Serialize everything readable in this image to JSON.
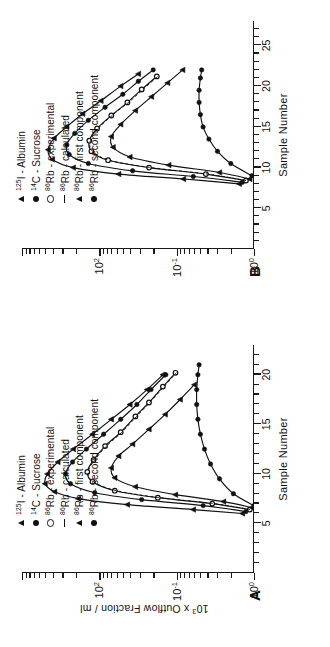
{
  "figure": {
    "orientation": "rotated-90-ccw",
    "panels": [
      {
        "letter": "A",
        "xaxis": {
          "title": "Sample Number",
          "ticks": [
            "5",
            "10",
            "15",
            "20"
          ],
          "tickvalues": [
            5,
            10,
            15,
            20
          ],
          "range": [
            0,
            23
          ]
        },
        "yaxis": {
          "title_pre": "10",
          "title_sup": "3",
          "title_post": " x  Outflow  Fraction / ml",
          "ticks": [
            "10",
            "10",
            "10"
          ],
          "tick_sups": [
            "0",
            "-1",
            "2"
          ],
          "scale": "log",
          "range": [
            1,
            200
          ]
        }
      },
      {
        "letter": "B",
        "xaxis": {
          "title": "Sample Number",
          "ticks": [
            "5",
            "10",
            "15",
            "20",
            "25"
          ],
          "tickvalues": [
            5,
            10,
            15,
            20,
            25
          ],
          "range": [
            0,
            28
          ]
        },
        "yaxis": {
          "title_pre": "10",
          "title_sup": "3",
          "title_post": " x  Outflow  Fraction / ml",
          "ticks": [
            "10",
            "10",
            "10"
          ],
          "tick_sups": [
            "0",
            "-1",
            "2"
          ],
          "scale": "log",
          "range": [
            1,
            200
          ]
        }
      }
    ]
  },
  "legend": {
    "items": [
      {
        "symbol": "filled-triangle-up",
        "iso_pre": "125",
        "element": "I",
        "sep": " - ",
        "label": "Albumin",
        "full": "125I - Albumin"
      },
      {
        "symbol": "filled-circle",
        "iso_pre": "14",
        "element": "C",
        "sep": " - ",
        "label": "Sucrose",
        "full": "14C - Sucrose"
      },
      {
        "symbol": "open-circle",
        "iso_pre": "86",
        "element": "Rb",
        "sep": " - ",
        "label": "experimental",
        "full": "86Rb - experimental"
      },
      {
        "symbol": "dash-line",
        "iso_pre": "86",
        "element": "Rb",
        "sep": " - ",
        "label": "calculated",
        "full": "86Rb - calculated"
      },
      {
        "symbol": "filled-triangle-up",
        "iso_pre": "86",
        "element": "Rb",
        "sep": " - ",
        "label": "first component",
        "full": "86Rb - first component"
      },
      {
        "symbol": "filled-circle",
        "iso_pre": "86",
        "element": "Rb",
        "sep": " - ",
        "label": "second component",
        "full": "86Rb - second component"
      }
    ]
  },
  "chart_data": [
    {
      "type": "line",
      "panel": "A",
      "title": "",
      "xlabel": "Sample Number",
      "ylabel": "10^3 x Outflow Fraction / ml",
      "xlim": [
        0,
        23
      ],
      "ylim": [
        1,
        200
      ],
      "yscale": "log",
      "grid": false,
      "legend_position": "top-right",
      "series": [
        {
          "name": "125I - Albumin",
          "marker": "filled-triangle-up",
          "x": [
            6.0,
            6.4,
            6.9,
            7.5,
            8.2,
            9.0,
            10.0,
            11.2,
            12.5,
            14.0,
            15.5,
            17.0,
            18.5,
            20.0
          ],
          "y": [
            1.3,
            4.0,
            18,
            55,
            95,
            118,
            112,
            88,
            62,
            40,
            26,
            17,
            11.5,
            8.0
          ]
        },
        {
          "name": "14C - Sucrose",
          "marker": "filled-circle",
          "x": [
            6.2,
            6.8,
            7.4,
            8.1,
            9.0,
            10.0,
            11.2,
            12.5,
            14.0,
            15.5,
            17.0,
            18.5,
            20.0
          ],
          "y": [
            1.2,
            3.2,
            13,
            38,
            66,
            74,
            63,
            46,
            31,
            21,
            14.5,
            10.5,
            7.5
          ]
        },
        {
          "name": "86Rb - experimental",
          "marker": "open-circle",
          "x": [
            6.4,
            7.0,
            7.6,
            8.3,
            9.2,
            10.2,
            11.4,
            12.8,
            14.2,
            15.8,
            17.2,
            18.8,
            20.2
          ],
          "y": [
            1.1,
            2.6,
            9.0,
            24,
            40,
            45,
            39,
            30,
            21,
            15,
            11,
            8.0,
            6.0
          ]
        },
        {
          "name": "86Rb - calculated",
          "marker": "dash-line",
          "x": [
            6.4,
            7.0,
            7.6,
            8.3,
            9.2,
            10.2,
            11.4,
            12.8,
            14.2,
            15.8,
            17.2,
            18.8,
            20.2
          ],
          "y": [
            1.1,
            2.5,
            8.6,
            23,
            39,
            44,
            38,
            29,
            20.5,
            14.6,
            10.8,
            7.8,
            5.9
          ]
        },
        {
          "name": "86Rb - first component",
          "marker": "filled-triangle-up",
          "x": [
            6.6,
            7.2,
            7.9,
            8.7,
            9.6,
            10.6,
            11.8,
            13.0,
            14.5,
            16.0,
            17.5,
            19.0
          ],
          "y": [
            1.05,
            2.0,
            6.0,
            15,
            24,
            26,
            22,
            16,
            11,
            7.6,
            5.4,
            3.9
          ]
        },
        {
          "name": "86Rb - second component",
          "marker": "filled-circle",
          "x": [
            6.8,
            8.0,
            9.5,
            11.0,
            12.5,
            14.0,
            15.5,
            17.0,
            18.5,
            20.0,
            21.0
          ],
          "y": [
            1.0,
            1.6,
            2.2,
            2.7,
            3.1,
            3.4,
            3.6,
            3.7,
            3.7,
            3.6,
            3.5
          ]
        }
      ]
    },
    {
      "type": "line",
      "panel": "B",
      "title": "",
      "xlabel": "Sample Number",
      "ylabel": "10^3 x Outflow Fraction / ml",
      "xlim": [
        0,
        28
      ],
      "ylim": [
        1,
        200
      ],
      "yscale": "log",
      "grid": false,
      "legend_position": "top-right",
      "series": [
        {
          "name": "125I - Albumin",
          "marker": "filled-triangle-up",
          "x": [
            8.0,
            8.6,
            9.2,
            10.0,
            11.0,
            12.2,
            13.6,
            15.0,
            16.6,
            18.2,
            20.0,
            21.5
          ],
          "y": [
            1.4,
            5.0,
            22,
            62,
            100,
            110,
            96,
            72,
            50,
            33,
            21,
            14
          ]
        },
        {
          "name": "14C - Sucrose",
          "marker": "filled-circle",
          "x": [
            8.2,
            8.9,
            9.6,
            10.5,
            11.6,
            12.8,
            14.2,
            15.8,
            17.4,
            19.0,
            20.6,
            22.0
          ],
          "y": [
            1.3,
            4.0,
            16,
            44,
            68,
            72,
            60,
            44,
            30,
            20,
            14,
            10
          ]
        },
        {
          "name": "86Rb - experimental",
          "marker": "open-circle",
          "x": [
            8.4,
            9.2,
            10.0,
            10.9,
            12.0,
            13.3,
            14.8,
            16.4,
            18.0,
            19.6,
            21.2
          ],
          "y": [
            1.2,
            3.0,
            11,
            28,
            41,
            43,
            36,
            26,
            18,
            13,
            9.2
          ]
        },
        {
          "name": "86Rb - calculated",
          "marker": "dash-line",
          "x": [
            8.4,
            9.2,
            10.0,
            10.9,
            12.0,
            13.3,
            14.8,
            16.4,
            18.0,
            19.6,
            21.2
          ],
          "y": [
            1.2,
            2.9,
            10.6,
            27,
            40,
            42,
            35,
            25.5,
            17.6,
            12.6,
            9.0
          ]
        },
        {
          "name": "86Rb - first component",
          "marker": "filled-triangle-up",
          "x": [
            8.6,
            9.4,
            10.3,
            11.3,
            12.5,
            13.8,
            15.3,
            17.0,
            18.7,
            20.4,
            22.0
          ],
          "y": [
            1.1,
            2.2,
            7.0,
            17,
            25,
            26,
            21,
            15,
            10.4,
            7.2,
            5.1
          ]
        },
        {
          "name": "86Rb - second component",
          "marker": "filled-circle",
          "x": [
            9.0,
            10.5,
            12.0,
            13.5,
            15.0,
            16.5,
            18.0,
            19.5,
            21.0,
            22.0
          ],
          "y": [
            1.05,
            1.7,
            2.3,
            2.8,
            3.2,
            3.4,
            3.5,
            3.5,
            3.4,
            3.3
          ]
        }
      ]
    }
  ]
}
